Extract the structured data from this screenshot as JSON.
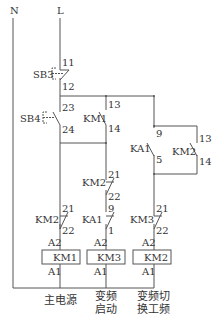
{
  "rails": {
    "neutral": "N",
    "live": "L"
  },
  "buttons": {
    "sb3": {
      "name": "SB3",
      "top": "11",
      "bottom": "12"
    },
    "sb4": {
      "name": "SB4",
      "top": "23",
      "bottom": "24"
    }
  },
  "contacts": {
    "km1_hold": {
      "name": "KM1",
      "top": "13",
      "bottom": "14"
    },
    "km2_interlock_mid": {
      "name": "KM2",
      "top": "21",
      "bottom": "22"
    },
    "km2_interlock_left": {
      "name": "KM2",
      "top": "21",
      "bottom": "22"
    },
    "ka1_mid": {
      "name": "KA1",
      "top": "9",
      "bottom": "1"
    },
    "ka1_right": {
      "name": "KA1",
      "top": "9",
      "bottom": "5"
    },
    "km2_hold": {
      "name": "KM2",
      "top": "13",
      "bottom": "14"
    },
    "km3_interlock": {
      "name": "KM3",
      "top": "21",
      "bottom": "22"
    }
  },
  "coils": [
    {
      "name": "KM1",
      "a2": "A2",
      "a1": "A1",
      "caption_line1": "主电源",
      "caption_line2": ""
    },
    {
      "name": "KM3",
      "a2": "A2",
      "a1": "A1",
      "caption_line1": "变频",
      "caption_line2": "启动"
    },
    {
      "name": "KM2",
      "a2": "A2",
      "a1": "A1",
      "caption_line1": "变频切",
      "caption_line2": "换工频"
    }
  ]
}
